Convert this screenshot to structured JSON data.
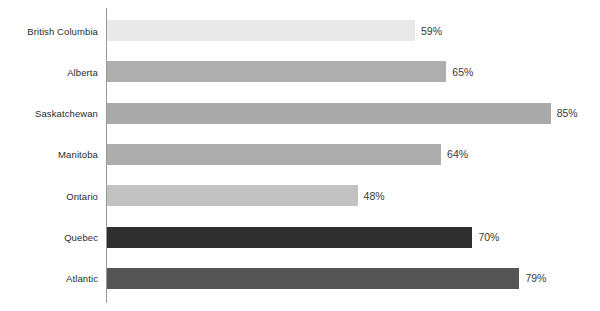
{
  "chart": {
    "type": "bar",
    "orientation": "horizontal",
    "background_color": "#ffffff",
    "axis_color": "#9a9a9a",
    "value_label_color": "#3a3a3a",
    "category_label_color": "#2b2b2b"
  },
  "chart_data": {
    "type": "bar",
    "title": "",
    "subtitle": "",
    "xlabel": "",
    "ylabel": "",
    "xlim": [
      0,
      100
    ],
    "grid": false,
    "legend": "none",
    "value_suffix": "%",
    "categories": [
      "British Columbia",
      "Alberta",
      "Saskatchewan",
      "Manitoba",
      "Ontario",
      "Quebec",
      "Atlantic"
    ],
    "values": [
      59,
      65,
      85,
      64,
      48,
      70,
      79
    ],
    "value_labels": [
      "59%",
      "65%",
      "85%",
      "64%",
      "48%",
      "70%",
      "79%"
    ],
    "bar_colors": [
      "#e9e9e9",
      "#aeaeae",
      "#aaaaaa",
      "#adadad",
      "#c2c2c2",
      "#2f2f2f",
      "#555555"
    ]
  }
}
